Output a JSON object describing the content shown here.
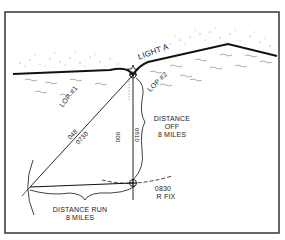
{
  "diagram": {
    "title_labels": {
      "light": "LIGHT A",
      "lop1": "LOP #1",
      "lop2": "LOP #2",
      "bearing1_top": "048",
      "bearing1_bottom": "0730",
      "bearing2_left": "000",
      "bearing2_right": "0810",
      "distance_off_line1": "DISTANCE",
      "distance_off_line2": "OFF",
      "distance_off_line3": "8 MILES",
      "fix_time": "0830",
      "fix_label": "R FIX",
      "distance_run_line1": "DISTANCE RUN",
      "distance_run_line2": "8 MILES"
    },
    "colors": {
      "ink": "#1a1a1a",
      "frame": "#333333",
      "stipple": "#555555",
      "background": "#ffffff"
    }
  }
}
